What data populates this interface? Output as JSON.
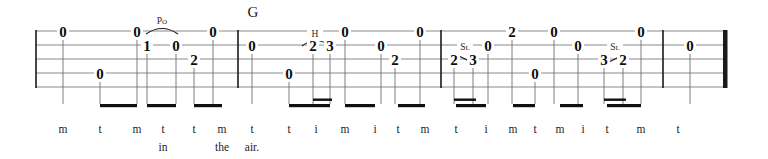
{
  "document": {
    "type": "tablature",
    "title": "",
    "instrument": "banjo-tab",
    "staff_lines": 5,
    "measures": 3,
    "ink_color": "#111111",
    "staff_color": "#8a8a8a",
    "barline_color": "#1a1a1a"
  },
  "chords": [
    {
      "name": "G",
      "x": 253,
      "y": 12
    }
  ],
  "techniques": [
    {
      "name": "Po",
      "label": "Po",
      "x": 162,
      "y": 22,
      "slur_from_x": 146,
      "slur_to_x": 178,
      "slur_y": 34
    },
    {
      "name": "H",
      "label": "H",
      "x": 315,
      "y": 35,
      "slur_from_x": 302,
      "slur_to_x": 330,
      "slur_y": 46
    },
    {
      "name": "Sl",
      "label": "Sl",
      "x": 465,
      "y": 48,
      "slant_from_x": 457,
      "slant_to_x": 473
    },
    {
      "name": "Sl",
      "label": "Sl",
      "x": 615,
      "y": 48,
      "slant_from_x": 607,
      "slant_to_x": 623
    }
  ],
  "notes": [
    {
      "fret": "0",
      "string": 1,
      "x": 63,
      "y": 32
    },
    {
      "fret": "0",
      "string": 4,
      "x": 100,
      "y": 74
    },
    {
      "fret": "0",
      "string": 1,
      "x": 137,
      "y": 32
    },
    {
      "fret": "1",
      "string": 2,
      "x": 147,
      "y": 46
    },
    {
      "fret": "0",
      "string": 2,
      "x": 176,
      "y": 46
    },
    {
      "fret": "0",
      "string": 1,
      "x": 213,
      "y": 32
    },
    {
      "fret": "2",
      "string": 3,
      "x": 194,
      "y": 60
    },
    {
      "fret": "0",
      "string": 2,
      "x": 252,
      "y": 46
    },
    {
      "fret": "0",
      "string": 4,
      "x": 289,
      "y": 74
    },
    {
      "fret": "2",
      "string": 2,
      "x": 313,
      "y": 46
    },
    {
      "fret": "3",
      "string": 2,
      "x": 330,
      "y": 46
    },
    {
      "fret": "0",
      "string": 1,
      "x": 345,
      "y": 32
    },
    {
      "fret": "0",
      "string": 2,
      "x": 381,
      "y": 46
    },
    {
      "fret": "2",
      "string": 3,
      "x": 395,
      "y": 60
    },
    {
      "fret": "0",
      "string": 1,
      "x": 420,
      "y": 32
    },
    {
      "fret": "2",
      "string": 2,
      "x": 454,
      "y": 60
    },
    {
      "fret": "3",
      "string": 2,
      "x": 473,
      "y": 60
    },
    {
      "fret": "0",
      "string": 2,
      "x": 488,
      "y": 46
    },
    {
      "fret": "2",
      "string": 1,
      "x": 512,
      "y": 32
    },
    {
      "fret": "0",
      "string": 4,
      "x": 535,
      "y": 74
    },
    {
      "fret": "0",
      "string": 1,
      "x": 554,
      "y": 32
    },
    {
      "fret": "0",
      "string": 2,
      "x": 578,
      "y": 46
    },
    {
      "fret": "3",
      "string": 2,
      "x": 604,
      "y": 60
    },
    {
      "fret": "2",
      "string": 2,
      "x": 623,
      "y": 60
    },
    {
      "fret": "0",
      "string": 1,
      "x": 641,
      "y": 32
    },
    {
      "fret": "0",
      "string": 2,
      "x": 690,
      "y": 46
    }
  ],
  "fingerings": [
    {
      "label": "m",
      "x": 63
    },
    {
      "label": "t",
      "x": 100
    },
    {
      "label": "m",
      "x": 137
    },
    {
      "label": "t",
      "x": 163
    },
    {
      "label": "t",
      "x": 194
    },
    {
      "label": "m",
      "x": 222
    },
    {
      "label": "t",
      "x": 252
    },
    {
      "label": "t",
      "x": 289
    },
    {
      "label": "i",
      "x": 316
    },
    {
      "label": "m",
      "x": 345
    },
    {
      "label": "i",
      "x": 375
    },
    {
      "label": "t",
      "x": 398
    },
    {
      "label": "m",
      "x": 425
    },
    {
      "label": "t",
      "x": 456
    },
    {
      "label": "i",
      "x": 486
    },
    {
      "label": "m",
      "x": 513
    },
    {
      "label": "t",
      "x": 535
    },
    {
      "label": "m",
      "x": 560
    },
    {
      "label": "i",
      "x": 583
    },
    {
      "label": "t",
      "x": 607
    },
    {
      "label": "m",
      "x": 641
    },
    {
      "label": "t",
      "x": 678
    }
  ],
  "lyrics": [
    {
      "word": "in",
      "x": 163
    },
    {
      "word": "the",
      "x": 222
    },
    {
      "word": "air.",
      "x": 252
    }
  ],
  "barlines": [
    {
      "kind": "start",
      "x": 36
    },
    {
      "kind": "single",
      "x": 238
    },
    {
      "kind": "single",
      "x": 441
    },
    {
      "kind": "single",
      "x": 663
    },
    {
      "kind": "final",
      "x": 723
    }
  ],
  "geometry": {
    "staff_top": 31,
    "staff_bottom": 87,
    "line_gap": 14,
    "staff_left": 36,
    "staff_right": 727,
    "beam_y": 104,
    "finger_y": 130,
    "lyric_y": 148
  }
}
